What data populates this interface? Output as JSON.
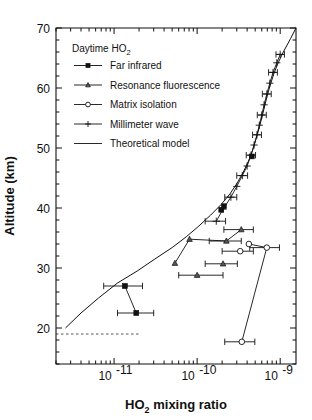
{
  "figure": {
    "title": "",
    "background": "#ffffff",
    "ink_color": "#111111"
  },
  "chart_data": {
    "type": "scatter",
    "title": "",
    "xlabel": "HO2 mixing ratio",
    "xlabel_base": "HO",
    "xlabel_sub": "2",
    "xlabel_rest": " mixing ratio",
    "ylabel": "Altitude (km)",
    "xscale": "log",
    "yscale": "linear",
    "xlim": [
      2e-12,
      1.55e-09
    ],
    "ylim": [
      14,
      70
    ],
    "grid": false,
    "legend_position": "upper-left",
    "legend_title": "Daytime HO2",
    "legend_title_base": "Daytime HO",
    "legend_title_sub": "2",
    "xticks_major": [
      {
        "value": 1e-11,
        "label": "10",
        "exponent": "-11"
      },
      {
        "value": 1e-10,
        "label": "10",
        "exponent": "-10"
      },
      {
        "value": 1e-09,
        "label": "10",
        "exponent": "-9"
      }
    ],
    "yticks_major": [
      20,
      30,
      40,
      50,
      60,
      70
    ],
    "yticks_minor_step": 2,
    "series": [
      {
        "name": "Far infrared",
        "marker": "square",
        "points": [
          {
            "x": 1.35e-11,
            "y": 27.0,
            "xerr_lo": 6e-12,
            "xerr_hi": 8.5e-12
          },
          {
            "x": 1.85e-11,
            "y": 22.5,
            "xerr_lo": 7.5e-12,
            "xerr_hi": 1.15e-11
          },
          {
            "x": 4.55e-10,
            "y": 48.6,
            "xerr_lo": 0.0,
            "xerr_hi": 0.0
          },
          {
            "x": 2.1e-10,
            "y": 40.3,
            "xerr_lo": 0.0,
            "xerr_hi": 0.0
          },
          {
            "x": 1.95e-10,
            "y": 39.7,
            "xerr_lo": 0.0,
            "xerr_hi": 0.0
          }
        ],
        "connect": [
          0,
          1
        ]
      },
      {
        "name": "Resonance fluorescence",
        "marker": "triangle",
        "points": [
          {
            "x": 5.4e-11,
            "y": 30.8,
            "xerr_lo": 0.0,
            "xerr_hi": 0.0
          },
          {
            "x": 8.1e-11,
            "y": 34.8,
            "xerr_lo": 0.0,
            "xerr_hi": 0.0
          },
          {
            "x": 2.25e-10,
            "y": 34.5,
            "xerr_lo": 8.5e-11,
            "xerr_hi": 1.15e-10
          },
          {
            "x": 3.4e-10,
            "y": 36.4,
            "xerr_lo": 1.3e-10,
            "xerr_hi": 1.35e-10
          },
          {
            "x": 2.05e-10,
            "y": 30.7,
            "xerr_lo": 8e-11,
            "xerr_hi": 1e-10
          },
          {
            "x": 1e-10,
            "y": 28.8,
            "xerr_lo": 4e-11,
            "xerr_hi": 1.05e-10
          }
        ],
        "connect": [
          0,
          1,
          2,
          3
        ]
      },
      {
        "name": "Matrix isolation",
        "marker": "circle",
        "points": [
          {
            "x": 4.2e-10,
            "y": 34.0,
            "xerr_lo": 0.0,
            "xerr_hi": 0.0
          },
          {
            "x": 6.9e-10,
            "y": 33.4,
            "xerr_lo": 2.6e-10,
            "xerr_hi": 2.9e-10
          },
          {
            "x": 3.3e-10,
            "y": 32.8,
            "xerr_lo": 1.3e-10,
            "xerr_hi": 1.45e-10
          },
          {
            "x": 3.45e-10,
            "y": 17.7,
            "xerr_lo": 1.3e-10,
            "xerr_hi": 1.5e-10
          }
        ],
        "connect": [
          0,
          1,
          3
        ]
      },
      {
        "name": "Millimeter wave",
        "marker": "plus",
        "points": [
          {
            "x": 1.7e-10,
            "y": 37.8,
            "xerr_lo": 4.5e-11,
            "xerr_hi": 5e-11
          },
          {
            "x": 2.05e-10,
            "y": 39.8,
            "xerr_lo": 0.0,
            "xerr_hi": 0.0
          },
          {
            "x": 2.55e-10,
            "y": 41.8,
            "xerr_lo": 4e-11,
            "xerr_hi": 4.5e-11
          },
          {
            "x": 3e-10,
            "y": 43.6,
            "xerr_lo": 0.0,
            "xerr_hi": 0.0
          },
          {
            "x": 3.5e-10,
            "y": 45.4,
            "xerr_lo": 5e-11,
            "xerr_hi": 5.5e-11
          },
          {
            "x": 4e-10,
            "y": 47.0,
            "xerr_lo": 0.0,
            "xerr_hi": 0.0
          },
          {
            "x": 4.45e-10,
            "y": 48.8,
            "xerr_lo": 5.5e-11,
            "xerr_hi": 6e-11
          },
          {
            "x": 4.85e-10,
            "y": 50.5,
            "xerr_lo": 0.0,
            "xerr_hi": 0.0
          },
          {
            "x": 5.25e-10,
            "y": 52.2,
            "xerr_lo": 6e-11,
            "xerr_hi": 7e-11
          },
          {
            "x": 5.6e-10,
            "y": 53.8,
            "xerr_lo": 0.0,
            "xerr_hi": 0.0
          },
          {
            "x": 6e-10,
            "y": 55.5,
            "xerr_lo": 7e-11,
            "xerr_hi": 8e-11
          },
          {
            "x": 6.4e-10,
            "y": 57.2,
            "xerr_lo": 0.0,
            "xerr_hi": 0.0
          },
          {
            "x": 6.9e-10,
            "y": 59.0,
            "xerr_lo": 8e-11,
            "xerr_hi": 9e-11
          },
          {
            "x": 7.5e-10,
            "y": 60.8,
            "xerr_lo": 0.0,
            "xerr_hi": 0.0
          },
          {
            "x": 8.2e-10,
            "y": 62.6,
            "xerr_lo": 9.5e-11,
            "xerr_hi": 1.05e-10
          },
          {
            "x": 9.1e-10,
            "y": 64.2,
            "xerr_lo": 0.0,
            "xerr_hi": 0.0
          },
          {
            "x": 1e-09,
            "y": 65.6,
            "xerr_lo": 1.1e-10,
            "xerr_hi": 1.25e-10
          }
        ],
        "connect": "all"
      },
      {
        "name": "Theoretical model",
        "marker": "line",
        "points": [
          {
            "x": 2.6e-12,
            "y": 20.0
          },
          {
            "x": 4e-12,
            "y": 22.5
          },
          {
            "x": 6.5e-12,
            "y": 25.0
          },
          {
            "x": 1.1e-11,
            "y": 27.5
          },
          {
            "x": 1.9e-11,
            "y": 29.5
          },
          {
            "x": 3.1e-11,
            "y": 31.5
          },
          {
            "x": 5e-11,
            "y": 33.4
          },
          {
            "x": 7.4e-11,
            "y": 35.2
          },
          {
            "x": 1.05e-10,
            "y": 37.0
          },
          {
            "x": 1.45e-10,
            "y": 38.8
          },
          {
            "x": 1.95e-10,
            "y": 40.6
          },
          {
            "x": 2.5e-10,
            "y": 42.4
          },
          {
            "x": 3.05e-10,
            "y": 44.2
          },
          {
            "x": 3.6e-10,
            "y": 46.0
          },
          {
            "x": 4.15e-10,
            "y": 47.8
          },
          {
            "x": 4.65e-10,
            "y": 49.6
          },
          {
            "x": 5.1e-10,
            "y": 51.4
          },
          {
            "x": 5.55e-10,
            "y": 53.2
          },
          {
            "x": 6e-10,
            "y": 55.0
          },
          {
            "x": 6.45e-10,
            "y": 56.8
          },
          {
            "x": 6.95e-10,
            "y": 58.6
          },
          {
            "x": 7.55e-10,
            "y": 60.4
          },
          {
            "x": 8.3e-10,
            "y": 62.2
          },
          {
            "x": 9.3e-10,
            "y": 64.0
          },
          {
            "x": 1.09e-09,
            "y": 66.0
          },
          {
            "x": 1.33e-09,
            "y": 68.2
          },
          {
            "x": 1.55e-09,
            "y": 70.0
          }
        ],
        "connect": "all"
      }
    ],
    "annotations": [
      {
        "name": "tropopause-dashed-line",
        "type": "hline-segment",
        "y": 19.0,
        "x_start": 2e-12,
        "x_end": 2e-11,
        "style": "dashed"
      }
    ],
    "legend_entries": [
      {
        "label": "Far infrared",
        "marker": "square"
      },
      {
        "label": "Resonance fluorescence",
        "marker": "triangle"
      },
      {
        "label": "Matrix isolation",
        "marker": "circle"
      },
      {
        "label": "Millimeter wave",
        "marker": "plus"
      },
      {
        "label": "Theoretical model",
        "marker": "line"
      }
    ]
  }
}
